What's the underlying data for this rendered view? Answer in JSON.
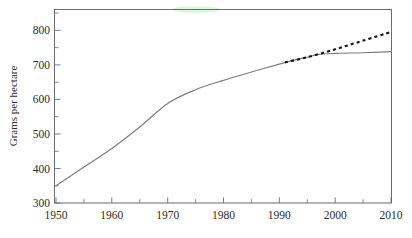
{
  "chart_data": {
    "type": "line",
    "title": "",
    "subtitle": "",
    "xlabel": "",
    "ylabel": "Grams per hectare",
    "xlim": [
      1950,
      2010
    ],
    "ylim": [
      300,
      850
    ],
    "grid": false,
    "legend_position": "none",
    "x_ticks": [
      1950,
      1960,
      1970,
      1980,
      1990,
      2000,
      2010
    ],
    "x_tick_labels": [
      "1950",
      "1960",
      "1970",
      "1980",
      "1990",
      "2000",
      "2010"
    ],
    "x_minor_ticks": [
      1955,
      1965,
      1975,
      1985,
      1995,
      2005
    ],
    "y_ticks": [
      300,
      400,
      500,
      600,
      700,
      800
    ],
    "y_tick_labels": [
      "300",
      "400",
      "500",
      "600",
      "700",
      "800"
    ],
    "y_minor_ticks": [
      350,
      450,
      550,
      650,
      750,
      850
    ],
    "series": [
      {
        "name": "Actual yield",
        "style": "solid",
        "color": "#7b7b84",
        "x": [
          1950,
          1955,
          1960,
          1965,
          1970,
          1975,
          1980,
          1985,
          1990,
          1993,
          1995,
          1997,
          2000,
          2005,
          2010
        ],
        "values": [
          350,
          404,
          458,
          520,
          588,
          628,
          655,
          679,
          702,
          715,
          722,
          730,
          733,
          735,
          738
        ]
      },
      {
        "name": "Trend projection",
        "style": "dashed",
        "color": "#15151a",
        "x": [
          1991,
          1995,
          2000,
          2005,
          2010
        ],
        "values": [
          707,
          722,
          745,
          770,
          795
        ]
      }
    ],
    "annotations": []
  },
  "axis": {
    "y_title": "Grams per hectare"
  }
}
